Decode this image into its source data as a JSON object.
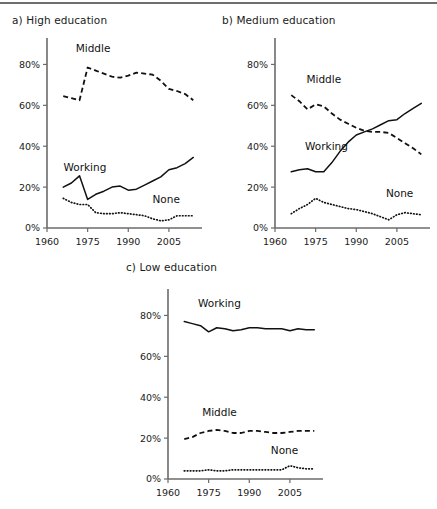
{
  "figure": {
    "panels": [
      {
        "id": "a",
        "title": "a) High education"
      },
      {
        "id": "b",
        "title": "b) Medium education"
      },
      {
        "id": "c",
        "title": "c) Low education"
      }
    ]
  },
  "chart_data": [
    {
      "type": "line",
      "title": "a) High education",
      "xlabel": "",
      "ylabel": "",
      "xlim": [
        1960,
        2015
      ],
      "ylim": [
        0,
        90
      ],
      "xticks": [
        1960,
        1975,
        1990,
        2005
      ],
      "yticks": [
        0,
        20,
        40,
        60,
        80
      ],
      "ytick_labels": [
        "0%",
        "20%",
        "40%",
        "60%",
        "80%"
      ],
      "xtick_labels": [
        "1960",
        "1975",
        "1990",
        "2005"
      ],
      "grid": false,
      "legend": "inline-annotations",
      "annotations": [
        {
          "text": "Middle",
          "x": 1977,
          "y": 86
        },
        {
          "text": "Working",
          "x": 1974,
          "y": 28
        },
        {
          "text": "None",
          "x": 2004,
          "y": 12
        }
      ],
      "series": [
        {
          "name": "Middle",
          "style": "dashed",
          "x": [
            1966,
            1969,
            1972,
            1975,
            1978,
            1981,
            1984,
            1987,
            1990,
            1993,
            1996,
            1999,
            2002,
            2005,
            2008,
            2011,
            2014
          ],
          "values": [
            64.5,
            63.5,
            62.5,
            78.5,
            77.0,
            75.5,
            74.0,
            73.5,
            74.5,
            76.0,
            75.5,
            75.0,
            72.0,
            68.0,
            67.0,
            65.5,
            62.5
          ]
        },
        {
          "name": "Working",
          "style": "solid",
          "x": [
            1966,
            1969,
            1972,
            1975,
            1978,
            1981,
            1984,
            1987,
            1990,
            1993,
            1996,
            1999,
            2002,
            2005,
            2008,
            2011,
            2014
          ],
          "values": [
            20.0,
            22.0,
            25.5,
            14.0,
            16.5,
            18.0,
            20.0,
            20.5,
            18.5,
            19.0,
            21.0,
            23.0,
            25.0,
            28.5,
            29.5,
            31.5,
            34.5
          ]
        },
        {
          "name": "None",
          "style": "dotted",
          "x": [
            1966,
            1969,
            1972,
            1975,
            1978,
            1981,
            1984,
            1987,
            1990,
            1993,
            1996,
            1999,
            2002,
            2005,
            2008,
            2011,
            2014
          ],
          "values": [
            14.5,
            12.5,
            11.5,
            11.5,
            7.5,
            7.0,
            7.0,
            7.5,
            7.0,
            6.5,
            6.0,
            4.5,
            3.5,
            4.0,
            6.0,
            6.0,
            6.0
          ]
        }
      ]
    },
    {
      "type": "line",
      "title": "b) Medium education",
      "xlabel": "",
      "ylabel": "",
      "xlim": [
        1960,
        2015
      ],
      "ylim": [
        0,
        90
      ],
      "xticks": [
        1960,
        1975,
        1990,
        2005
      ],
      "yticks": [
        0,
        20,
        40,
        60,
        80
      ],
      "ytick_labels": [
        "0%",
        "20%",
        "40%",
        "60%",
        "80%"
      ],
      "xtick_labels": [
        "1960",
        "1975",
        "1990",
        "2005"
      ],
      "grid": false,
      "legend": "inline-annotations",
      "annotations": [
        {
          "text": "Middle",
          "x": 1978,
          "y": 71
        },
        {
          "text": "Working",
          "x": 1979,
          "y": 38
        },
        {
          "text": "None",
          "x": 2006,
          "y": 15
        }
      ],
      "series": [
        {
          "name": "Middle",
          "style": "dashed",
          "x": [
            1966,
            1969,
            1972,
            1975,
            1978,
            1981,
            1984,
            1987,
            1990,
            1993,
            1996,
            1999,
            2002,
            2005,
            2008,
            2011,
            2014
          ],
          "values": [
            65.0,
            62.0,
            58.0,
            60.5,
            59.5,
            56.0,
            53.0,
            51.0,
            49.0,
            47.5,
            47.0,
            47.0,
            46.5,
            44.0,
            41.5,
            39.0,
            36.0
          ]
        },
        {
          "name": "Working",
          "style": "solid",
          "x": [
            1966,
            1969,
            1972,
            1975,
            1978,
            1981,
            1984,
            1987,
            1990,
            1993,
            1996,
            1999,
            2002,
            2005,
            2008,
            2011,
            2014
          ],
          "values": [
            27.5,
            28.5,
            29.0,
            27.5,
            27.5,
            32.0,
            37.5,
            42.0,
            45.5,
            47.0,
            48.5,
            50.5,
            52.5,
            53.0,
            56.0,
            58.5,
            61.0
          ]
        },
        {
          "name": "None",
          "style": "dotted",
          "x": [
            1966,
            1969,
            1972,
            1975,
            1978,
            1981,
            1984,
            1987,
            1990,
            1993,
            1996,
            1999,
            2002,
            2005,
            2008,
            2011,
            2014
          ],
          "values": [
            7.0,
            9.5,
            11.5,
            14.5,
            12.5,
            11.5,
            10.5,
            9.5,
            9.0,
            8.0,
            7.0,
            5.5,
            4.0,
            6.5,
            7.5,
            7.0,
            6.5
          ]
        }
      ]
    },
    {
      "type": "line",
      "title": "c) Low education",
      "xlabel": "",
      "ylabel": "",
      "xlim": [
        1960,
        2015
      ],
      "ylim": [
        0,
        90
      ],
      "xticks": [
        1960,
        1975,
        1990,
        2005
      ],
      "yticks": [
        0,
        20,
        40,
        60,
        80
      ],
      "ytick_labels": [
        "0%",
        "20%",
        "40%",
        "60%",
        "80%"
      ],
      "xtick_labels": [
        "1960",
        "1975",
        "1990",
        "2005"
      ],
      "grid": false,
      "legend": "inline-annotations",
      "annotations": [
        {
          "text": "Working",
          "x": 1979,
          "y": 84
        },
        {
          "text": "Middle",
          "x": 1979,
          "y": 31
        },
        {
          "text": "None",
          "x": 2003,
          "y": 12
        }
      ],
      "series": [
        {
          "name": "Working",
          "style": "solid",
          "x": [
            1966,
            1969,
            1972,
            1975,
            1978,
            1981,
            1984,
            1987,
            1990,
            1993,
            1996,
            1999,
            2002,
            2005,
            2008,
            2011,
            2014
          ],
          "values": [
            77.0,
            76.0,
            75.0,
            72.0,
            74.0,
            73.5,
            72.5,
            73.0,
            74.0,
            74.0,
            73.5,
            73.5,
            73.5,
            72.5,
            73.5,
            73.0,
            73.0
          ]
        },
        {
          "name": "Middle",
          "style": "dashed",
          "x": [
            1966,
            1969,
            1972,
            1975,
            1978,
            1981,
            1984,
            1987,
            1990,
            1993,
            1996,
            1999,
            2002,
            2005,
            2008,
            2011,
            2014
          ],
          "values": [
            19.5,
            20.5,
            22.5,
            23.5,
            24.0,
            23.5,
            22.5,
            22.5,
            23.5,
            23.5,
            23.0,
            22.5,
            22.5,
            23.0,
            23.5,
            23.5,
            23.5
          ]
        },
        {
          "name": "None",
          "style": "dotted",
          "x": [
            1966,
            1969,
            1972,
            1975,
            1978,
            1981,
            1984,
            1987,
            1990,
            1993,
            1996,
            1999,
            2002,
            2005,
            2008,
            2011,
            2014
          ],
          "values": [
            4.0,
            4.0,
            4.0,
            4.5,
            4.0,
            4.0,
            4.5,
            4.5,
            4.5,
            4.5,
            4.5,
            4.5,
            4.5,
            6.5,
            5.5,
            5.0,
            5.0
          ]
        }
      ]
    }
  ]
}
